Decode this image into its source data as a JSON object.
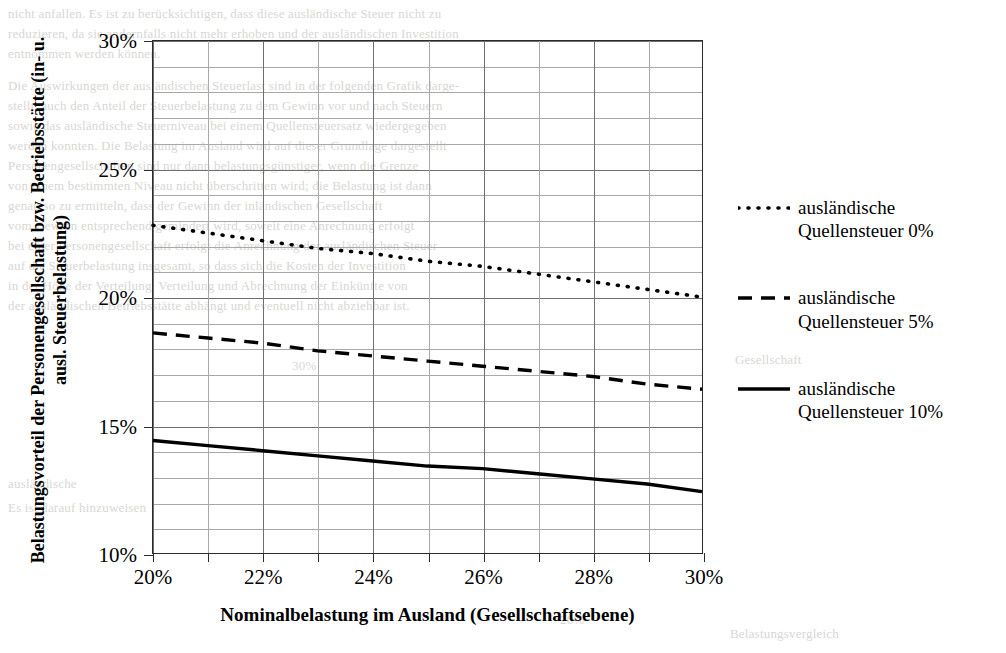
{
  "chart_data": {
    "type": "line",
    "title": "",
    "xlabel": "Nominalbelastung im Ausland (Gesellschaftsebene)",
    "ylabel": "Belastungsvorteil der Personengesellschaft bzw. Betriebsstätte (in- u. ausl. Steuerbelastung)",
    "xlim": [
      20,
      30
    ],
    "ylim": [
      10,
      30
    ],
    "x_tick_labels": [
      "20%",
      "22%",
      "24%",
      "26%",
      "28%",
      "30%"
    ],
    "x_tick_values": [
      20,
      22,
      24,
      26,
      28,
      30
    ],
    "y_tick_labels": [
      "10%",
      "15%",
      "20%",
      "25%",
      "30%"
    ],
    "y_tick_values": [
      10,
      15,
      20,
      25,
      30
    ],
    "x_minor_step": 1,
    "y_minor_step": 1,
    "grid": "both",
    "legend_position": "right",
    "x": [
      20,
      21,
      22,
      23,
      24,
      25,
      26,
      27,
      28,
      29,
      30
    ],
    "series": [
      {
        "name": "ausländische\nQuellensteuer 0%",
        "style": "dotted",
        "color": "#000000",
        "values": [
          22.8,
          22.5,
          22.2,
          21.9,
          21.7,
          21.4,
          21.2,
          20.9,
          20.6,
          20.3,
          20.0
        ]
      },
      {
        "name": "ausländische\nQuellensteuer 5%",
        "style": "dashed",
        "color": "#000000",
        "values": [
          18.6,
          18.4,
          18.2,
          17.9,
          17.7,
          17.5,
          17.3,
          17.1,
          16.9,
          16.6,
          16.4
        ]
      },
      {
        "name": "ausländische\nQuellensteuer 10%",
        "style": "solid",
        "color": "#000000",
        "values": [
          14.4,
          14.2,
          14.0,
          13.8,
          13.6,
          13.4,
          13.3,
          13.1,
          12.9,
          12.7,
          12.4
        ]
      }
    ]
  },
  "axes": {
    "y_labels": [
      "30%",
      "25%",
      "20%",
      "15%",
      "10%"
    ],
    "x_labels": [
      "20%",
      "22%",
      "24%",
      "26%",
      "28%",
      "30%"
    ],
    "x_title": "Nominalbelastung im Ausland (Gesellschaftsebene)",
    "y_title": "Belastungsvorteil der Personengesellschaft bzw. Betriebsstätte (in- u. ausl. Steuerbelastung)"
  },
  "legend": {
    "items": [
      {
        "label": "ausländische\nQuellensteuer 0%",
        "style": "dotted"
      },
      {
        "label": "ausländische\nQuellensteuer 5%",
        "style": "dashed"
      },
      {
        "label": "ausländische\nQuellensteuer 10%",
        "style": "solid"
      }
    ]
  },
  "background_text": {
    "lines": [
      {
        "text": "nicht anfallen. Es ist zu berücksichtigen, dass diese ausländische Steuer nicht zu",
        "x": 8,
        "y": 6
      },
      {
        "text": "reduzieren, da sie andernfalls nicht mehr erhoben und der ausländischen Investition",
        "x": 8,
        "y": 26
      },
      {
        "text": "entnommen werden können.",
        "x": 8,
        "y": 46
      },
      {
        "text": "Die Auswirkungen der ausländischen Steuerlast sind in der folgenden Grafik darge-",
        "x": 8,
        "y": 78
      },
      {
        "text": "stellt, auch den Anteil der Steuerbelastung zu dem Gewinn vor und nach Steuern",
        "x": 8,
        "y": 98
      },
      {
        "text": "sowie das ausländische Steuerniveau bei einem Quellensteuersatz wiedergegeben",
        "x": 8,
        "y": 118
      },
      {
        "text": "werden konnten. Die Belastung im Ausland wird auf dieser Grundlage dargestellt",
        "x": 8,
        "y": 138
      },
      {
        "text": "Personengesellschaften sind nur dann belastungsgünstiger, wenn die Grenze",
        "x": 8,
        "y": 158
      },
      {
        "text": "von einem bestimmten Niveau nicht überschritten wird; die Belastung ist dann",
        "x": 8,
        "y": 178
      },
      {
        "text": "genau so zu ermitteln, dass der Gewinn der inländischen Gesellschaft",
        "x": 8,
        "y": 198
      },
      {
        "text": "vom Gewinn entsprechend gemindert wird, soweit eine Anrechnung erfolgt",
        "x": 8,
        "y": 218
      },
      {
        "text": "bei einer Personengesellschaft erfolgt die Anrechnung der ausländischen Steuer",
        "x": 8,
        "y": 238
      },
      {
        "text": "auf die Steuerbelastung insgesamt, so dass sich die Kosten der Investition",
        "x": 8,
        "y": 258
      },
      {
        "text": "in der Höhe der Verteilung, Verteilung und Abrechnung der Einkünfte von",
        "x": 8,
        "y": 278
      },
      {
        "text": "der ausländischen Betriebsstätte abhängt und eventuell nicht abziehbar ist.",
        "x": 8,
        "y": 298
      },
      {
        "text": "30%",
        "x": 292,
        "y": 358
      },
      {
        "text": "Gesellschaft",
        "x": 735,
        "y": 352
      },
      {
        "text": "ausländische",
        "x": 8,
        "y": 476
      },
      {
        "text": "Es ist darauf hinzuweisen",
        "x": 8,
        "y": 500
      },
      {
        "text": "20%",
        "x": 560,
        "y": 612
      },
      {
        "text": "Belastungsvergleich",
        "x": 730,
        "y": 626
      }
    ]
  }
}
